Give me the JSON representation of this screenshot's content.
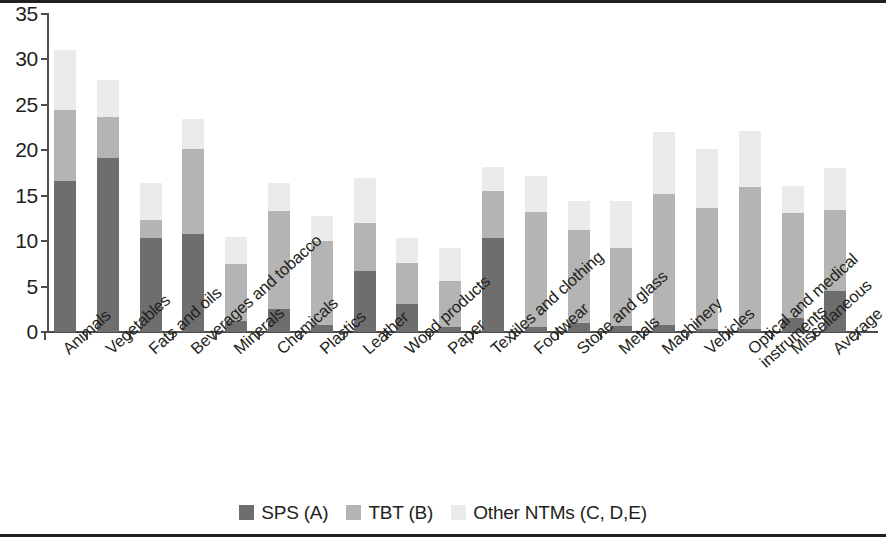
{
  "chart_data": {
    "type": "bar",
    "subtype": "stacked-bar",
    "title": "",
    "xlabel": "",
    "ylabel": "",
    "ylim": [
      0,
      35
    ],
    "ytick_values": [
      0,
      5,
      10,
      15,
      20,
      25,
      30,
      35
    ],
    "ytick_labels": [
      "0",
      "5",
      "10",
      "15",
      "20",
      "25",
      "30",
      "35"
    ],
    "grid": false,
    "legend_position": "bottom-center",
    "categories": [
      "Animals",
      "Vegetables",
      "Fats and oils",
      "Beverages and tobacco",
      "Minerals",
      "Chemicals",
      "Plastics",
      "Leather",
      "Wood products",
      "Paper",
      "Textiles and clothing",
      "Footwear",
      "Stone and glass",
      "Metals",
      "Machinery",
      "Vehicles",
      "Optical and medical instruments",
      "Miscellaneous",
      "Average"
    ],
    "category_label_lines": [
      [
        "Animals"
      ],
      [
        "Vegetables"
      ],
      [
        "Fats and oils"
      ],
      [
        "Beverages and tobacco"
      ],
      [
        "Minerals"
      ],
      [
        "Chemicals"
      ],
      [
        "Plastics"
      ],
      [
        "Leather"
      ],
      [
        "Wood products"
      ],
      [
        "Paper"
      ],
      [
        "Textiles and clothing"
      ],
      [
        "Footwear"
      ],
      [
        "Stone and glass"
      ],
      [
        "Metals"
      ],
      [
        "Machinery"
      ],
      [
        "Vehicles"
      ],
      [
        "Optical and medical",
        "instruments"
      ],
      [
        "Miscellaneous"
      ],
      [
        "Average"
      ]
    ],
    "series": [
      {
        "name": "SPS (A)",
        "color": "#6e6e6e",
        "values": [
          16.6,
          19.1,
          10.3,
          10.8,
          1.2,
          2.5,
          0.8,
          6.7,
          3.1,
          0.6,
          10.4,
          0.6,
          1.0,
          0.7,
          0.8,
          0.3,
          0.3,
          1.5,
          4.5
        ]
      },
      {
        "name": "TBT (B)",
        "color": "#b4b4b4",
        "values": [
          7.8,
          4.6,
          2.0,
          9.3,
          6.3,
          10.8,
          9.2,
          5.3,
          4.5,
          5.0,
          5.1,
          12.6,
          10.2,
          8.6,
          14.4,
          13.4,
          15.7,
          11.6,
          8.9
        ]
      },
      {
        "name": "Other NTMs (C, D,E)",
        "color": "#ebebeb",
        "values": [
          6.6,
          4.0,
          4.1,
          3.3,
          3.0,
          3.1,
          2.8,
          4.9,
          2.7,
          3.6,
          2.7,
          4.0,
          3.2,
          5.1,
          6.8,
          6.5,
          6.1,
          3.0,
          4.6
        ]
      }
    ],
    "totals": [
      31.0,
      27.7,
      16.4,
      23.4,
      10.5,
      16.4,
      12.8,
      16.9,
      10.3,
      9.2,
      18.2,
      17.2,
      14.4,
      14.4,
      22.0,
      20.2,
      22.1,
      16.1,
      18.0
    ]
  },
  "legend": {
    "items": [
      {
        "label": "SPS (A)",
        "color": "#6e6e6e",
        "swatch_name": "legend-swatch-sps"
      },
      {
        "label": "TBT (B)",
        "color": "#b4b4b4",
        "swatch_name": "legend-swatch-tbt"
      },
      {
        "label": "Other NTMs (C, D,E)",
        "color": "#ebebeb",
        "swatch_name": "legend-swatch-other"
      }
    ]
  },
  "colors": {
    "sps": "#6e6e6e",
    "tbt": "#b4b4b4",
    "other": "#ebebeb",
    "axis": "#4d4d4d",
    "text": "#231f20",
    "background": "#ffffff"
  }
}
